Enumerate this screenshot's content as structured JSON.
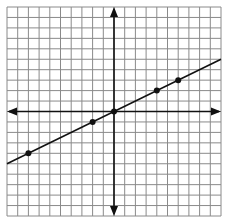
{
  "graph": {
    "x_range": [
      -10,
      10
    ],
    "y_range": [
      -10,
      10
    ],
    "grid_step": 1,
    "line": {
      "slope": 0.5,
      "intercept": 0
    },
    "points": [
      [
        -8,
        -4
      ],
      [
        -2,
        -1
      ],
      [
        0,
        0
      ],
      [
        4,
        2
      ],
      [
        6,
        3
      ]
    ],
    "colors": {
      "grid": "#8a8a8a",
      "axis": "#111111",
      "line": "#111111",
      "point": "#111111"
    }
  }
}
